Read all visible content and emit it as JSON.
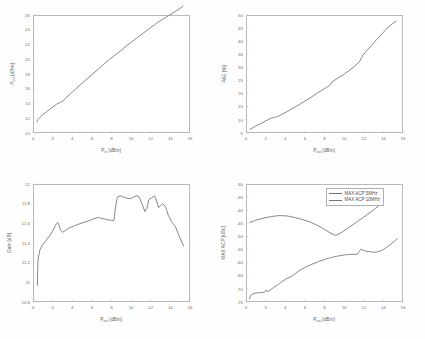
{
  "figure": {
    "background": "#ffffff",
    "line_color": "#6c7280",
    "axis_color": "#b9b9b9"
  },
  "chart_data": [
    {
      "id": "plot-pout-vs-pin",
      "type": "line",
      "title": "",
      "xlabel": "P_in [dBm]",
      "xlabel_main": "P",
      "xlabel_sub": "in",
      "xlabel_unit": "[dBm]",
      "ylabel": "P_out [dBm]",
      "ylabel_main": "P",
      "ylabel_sub": "out",
      "ylabel_unit": "[dBm]",
      "xlim": [
        0,
        16
      ],
      "ylim": [
        10,
        26
      ],
      "xticks": [
        0,
        2,
        4,
        6,
        8,
        10,
        12,
        14,
        16
      ],
      "yticks": [
        10,
        12,
        14,
        16,
        18,
        20,
        22,
        24,
        26
      ],
      "grid": false,
      "legend": null,
      "series": [
        {
          "name": "Pout",
          "x": [
            0.4,
            0.5,
            0.7,
            1.0,
            1.4,
            1.9,
            2.4,
            2.8,
            3.0,
            3.3,
            3.8,
            4.3,
            4.8,
            5.4,
            6.0,
            6.6,
            7.2,
            7.8,
            8.3,
            8.6,
            9.0,
            9.6,
            10.2,
            10.8,
            11.4,
            12.0,
            12.4,
            12.7,
            13.2,
            13.8,
            14.4,
            15.0,
            15.3
          ],
          "y": [
            11.5,
            11.8,
            12.1,
            12.5,
            12.9,
            13.4,
            13.9,
            14.2,
            14.3,
            14.7,
            15.3,
            15.9,
            16.5,
            17.2,
            17.9,
            18.6,
            19.3,
            20.0,
            20.5,
            20.8,
            21.2,
            21.9,
            22.5,
            23.1,
            23.7,
            24.3,
            24.7,
            25.0,
            25.4,
            25.9,
            26.4,
            26.9,
            27.2
          ]
        }
      ]
    },
    {
      "id": "plot-pae-vs-pout",
      "type": "line",
      "title": "",
      "xlabel": "P_out [dBm]",
      "xlabel_main": "P",
      "xlabel_sub": "out",
      "xlabel_unit": "[dBm]",
      "ylabel": "PAE [%]",
      "xlim": [
        0,
        16
      ],
      "ylim": [
        5,
        50
      ],
      "xticks": [
        0,
        2,
        4,
        6,
        8,
        10,
        12,
        14,
        16
      ],
      "yticks": [
        5,
        10,
        15,
        20,
        25,
        30,
        35,
        40,
        45,
        50
      ],
      "grid": false,
      "legend": null,
      "series": [
        {
          "name": "PAE",
          "x": [
            0.4,
            0.7,
            1.0,
            1.5,
            2.0,
            2.5,
            2.9,
            3.2,
            3.6,
            4.2,
            4.8,
            5.5,
            6.2,
            6.9,
            7.6,
            8.2,
            8.5,
            8.8,
            9.3,
            9.9,
            10.5,
            11.1,
            11.6,
            11.9,
            12.3,
            12.8,
            13.3,
            13.9,
            14.5,
            15.0,
            15.3
          ],
          "y": [
            6.3,
            7.0,
            7.7,
            8.6,
            9.6,
            10.6,
            11.0,
            11.2,
            12.0,
            13.2,
            14.5,
            16.0,
            17.6,
            19.3,
            21.0,
            22.4,
            23.0,
            24.6,
            25.8,
            27.2,
            28.8,
            30.5,
            32.4,
            34.6,
            36.4,
            38.4,
            40.6,
            43.0,
            45.4,
            46.9,
            47.6
          ]
        }
      ]
    },
    {
      "id": "plot-gain-vs-pout",
      "type": "line",
      "title": "",
      "xlabel": "P_out [dBm]",
      "xlabel_main": "P",
      "xlabel_sub": "out",
      "xlabel_unit": "[dBm]",
      "ylabel": "Gain [dB]",
      "xlim": [
        0,
        16
      ],
      "ylim": [
        10.8,
        12.0
      ],
      "xticks": [
        0,
        2,
        4,
        6,
        8,
        10,
        12,
        14,
        16
      ],
      "yticks": [
        10.8,
        11,
        11.2,
        11.4,
        11.6,
        11.8,
        12
      ],
      "grid": false,
      "legend": null,
      "series": [
        {
          "name": "Gain",
          "x": [
            0.45,
            0.5,
            0.7,
            0.9,
            1.2,
            1.6,
            2.0,
            2.3,
            2.5,
            2.6,
            2.8,
            3.0,
            3.2,
            3.6,
            4.1,
            4.6,
            5.2,
            5.8,
            6.3,
            6.7,
            7.0,
            7.5,
            8.0,
            8.25,
            8.4,
            8.6,
            8.9,
            9.4,
            9.9,
            10.3,
            10.6,
            10.8,
            11.1,
            11.4,
            11.6,
            11.8,
            12.1,
            12.4,
            12.55,
            12.8,
            13.0,
            13.2,
            13.5,
            13.8,
            14.1,
            14.5,
            14.9,
            15.2,
            15.35
          ],
          "y": [
            10.97,
            11.22,
            11.33,
            11.37,
            11.41,
            11.46,
            11.52,
            11.58,
            11.61,
            11.6,
            11.53,
            11.51,
            11.52,
            11.55,
            11.57,
            11.59,
            11.61,
            11.63,
            11.65,
            11.66,
            11.65,
            11.64,
            11.63,
            11.63,
            11.76,
            11.87,
            11.88,
            11.86,
            11.85,
            11.87,
            11.88,
            11.87,
            11.8,
            11.72,
            11.75,
            11.84,
            11.86,
            11.88,
            11.84,
            11.76,
            11.78,
            11.8,
            11.77,
            11.68,
            11.62,
            11.57,
            11.47,
            11.4,
            11.37
          ]
        }
      ]
    },
    {
      "id": "plot-maxacp-vs-pout",
      "type": "line",
      "title": "",
      "xlabel": "P_out [dBm]",
      "xlabel_main": "P",
      "xlabel_sub": "out",
      "xlabel_unit": "[dBm]",
      "ylabel": "MAX ACP [dBc]",
      "xlim": [
        0,
        16
      ],
      "ylim": [
        -75,
        -30
      ],
      "xticks": [
        0,
        2,
        4,
        6,
        8,
        10,
        12,
        14,
        16
      ],
      "yticks": [
        -75,
        -70,
        -65,
        -60,
        -55,
        -50,
        -45,
        -40,
        -35,
        -30
      ],
      "grid": false,
      "legend": {
        "position": "top-right",
        "entries": [
          "MAX ACP 5MHz",
          "MAX ACP 10MHz"
        ]
      },
      "series": [
        {
          "name": "MAX ACP 5MHz",
          "x": [
            0.4,
            1.0,
            1.8,
            2.6,
            3.2,
            3.6,
            4.2,
            5.0,
            5.8,
            6.6,
            7.3,
            8.0,
            8.6,
            9.0,
            9.2,
            9.6,
            10.2,
            10.8,
            11.4,
            12.0,
            12.6,
            13.2,
            13.8,
            14.0
          ],
          "y": [
            -44.7,
            -43.8,
            -43.0,
            -42.4,
            -42.1,
            -42.05,
            -42.2,
            -42.8,
            -43.6,
            -44.6,
            -45.8,
            -47.3,
            -48.7,
            -49.4,
            -49.5,
            -48.8,
            -47.3,
            -45.8,
            -44.2,
            -42.6,
            -41.0,
            -39.3,
            -37.4,
            -36.6
          ]
        },
        {
          "name": "MAX ACP 10MHz",
          "x": [
            0.35,
            0.5,
            0.8,
            1.2,
            1.6,
            1.9,
            2.0,
            2.3,
            2.8,
            3.4,
            4.0,
            4.6,
            5.2,
            5.6,
            6.2,
            6.8,
            7.4,
            8.0,
            8.6,
            9.2,
            9.8,
            10.4,
            11.0,
            11.3,
            11.5,
            11.7,
            11.9,
            12.2,
            12.6,
            13.0,
            13.4,
            13.8,
            14.2,
            14.6,
            15.0,
            15.4
          ],
          "y": [
            -73.8,
            -72.4,
            -71.7,
            -71.5,
            -71.4,
            -71.2,
            -70.6,
            -70.9,
            -69.5,
            -68.0,
            -66.4,
            -65.3,
            -63.7,
            -62.6,
            -61.5,
            -60.5,
            -59.6,
            -58.8,
            -58.1,
            -57.6,
            -57.2,
            -56.9,
            -56.8,
            -56.9,
            -56.0,
            -54.9,
            -55.2,
            -55.6,
            -55.8,
            -56.0,
            -55.9,
            -55.4,
            -54.5,
            -53.4,
            -52.2,
            -50.9
          ]
        }
      ]
    }
  ]
}
